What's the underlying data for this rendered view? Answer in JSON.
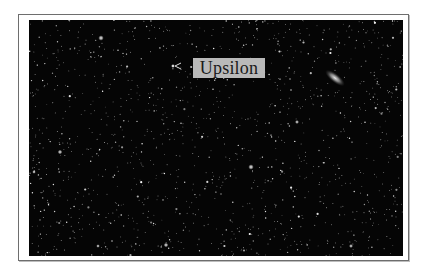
{
  "image": {
    "description": "Starfield photograph with a labeled star",
    "label": "Upsilon",
    "colors": {
      "background": "#ffffff",
      "frame_border": "#6e6e6e",
      "sky": "#050505",
      "label_bg": "#b9b9b9",
      "label_text": "#1a1a1a"
    },
    "features": [
      "dense-starfield",
      "elongated-galaxy-upper-right",
      "marker-near-label"
    ]
  }
}
